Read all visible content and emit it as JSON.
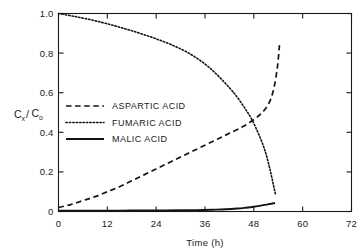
{
  "chart_data": {
    "type": "line",
    "title": "",
    "xlabel": "Time (h)",
    "ylabel": "Cx/Co",
    "ylabel_parts": {
      "c1": "C",
      "sub1": "x",
      "slash": "/",
      "c2": "C",
      "sub2": "o"
    },
    "xlim": [
      0,
      72
    ],
    "ylim": [
      0,
      1.0
    ],
    "xticks": [
      0,
      12,
      24,
      36,
      48,
      60,
      72
    ],
    "xticklabels": [
      "0",
      "12",
      "24",
      "36",
      "48",
      "60",
      "72"
    ],
    "yticks": [
      0,
      0.2,
      0.4,
      0.6,
      0.8,
      1.0
    ],
    "yticklabels": [
      "0",
      "0.2",
      "0.4",
      "0.6",
      "0.8",
      "1.0"
    ],
    "grid": false,
    "legend_position": "center-left",
    "frame": "box",
    "tick_direction": "in",
    "series": [
      {
        "name": "ASPARTIC ACID",
        "style": "dashed",
        "color": "#141414",
        "x": [
          0,
          3,
          6,
          9,
          12,
          15,
          18,
          21,
          24,
          27,
          30,
          33,
          36,
          39,
          42,
          45,
          47,
          49,
          50.5,
          52,
          53,
          53.8,
          54.3
        ],
        "y": [
          0.02,
          0.035,
          0.055,
          0.075,
          0.1,
          0.125,
          0.155,
          0.185,
          0.215,
          0.245,
          0.275,
          0.305,
          0.335,
          0.365,
          0.395,
          0.425,
          0.45,
          0.48,
          0.51,
          0.56,
          0.63,
          0.73,
          0.84
        ]
      },
      {
        "name": "FUMARIC ACID",
        "style": "dotted",
        "color": "#141414",
        "x": [
          0,
          4,
          8,
          12,
          16,
          20,
          24,
          28,
          32,
          36,
          39,
          42,
          44,
          46,
          47.5,
          49,
          50,
          51,
          52,
          52.8,
          53.4
        ],
        "y": [
          1.0,
          0.985,
          0.968,
          0.948,
          0.925,
          0.9,
          0.872,
          0.84,
          0.8,
          0.745,
          0.69,
          0.625,
          0.575,
          0.515,
          0.465,
          0.4,
          0.35,
          0.29,
          0.21,
          0.135,
          0.08
        ]
      },
      {
        "name": "MALIC ACID",
        "style": "solid",
        "color": "#141414",
        "x": [
          0,
          6,
          12,
          18,
          24,
          30,
          34,
          38,
          41,
          44,
          46,
          48,
          50,
          51.5,
          52.5,
          53.2
        ],
        "y": [
          0.004,
          0.004,
          0.004,
          0.005,
          0.005,
          0.006,
          0.007,
          0.009,
          0.011,
          0.015,
          0.019,
          0.024,
          0.031,
          0.036,
          0.04,
          0.043
        ]
      }
    ],
    "legend": [
      {
        "label": "ASPARTIC ACID",
        "style": "dashed"
      },
      {
        "label": "FUMARIC ACID",
        "style": "dotted"
      },
      {
        "label": "MALIC ACID",
        "style": "solid"
      }
    ]
  }
}
